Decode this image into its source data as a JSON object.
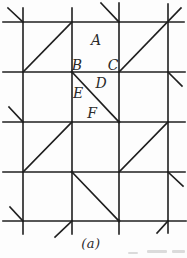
{
  "figure": {
    "type": "lattice-diagram",
    "caption": "(a)",
    "colors": {
      "background": "#fdfdfd",
      "line": "#1f1f1f",
      "label": "#2b2b2b",
      "artifact": "#8f8f8f"
    },
    "canvas": {
      "width": 187,
      "height": 258
    },
    "grid": {
      "vertical_lines": [
        {
          "x": 23,
          "y1": 8,
          "y2": 234
        },
        {
          "x": 72,
          "y1": 8,
          "y2": 234
        },
        {
          "x": 119,
          "y1": 3,
          "y2": 234
        },
        {
          "x": 168,
          "y1": 4,
          "y2": 233
        }
      ],
      "horizontal_lines": [
        {
          "y": 22,
          "x1": 3,
          "x2": 184
        },
        {
          "y": 72,
          "x1": 3,
          "x2": 185
        },
        {
          "y": 122,
          "x1": 3,
          "x2": 185
        },
        {
          "y": 172,
          "x1": 3,
          "x2": 185
        },
        {
          "y": 221,
          "x1": 3,
          "x2": 186
        }
      ],
      "diagonals": [
        {
          "x1": 23,
          "y1": 72,
          "x2": 72,
          "y2": 22
        },
        {
          "x1": 119,
          "y1": 72,
          "x2": 181,
          "y2": 8
        },
        {
          "x1": 72,
          "y1": 72,
          "x2": 119,
          "y2": 122
        },
        {
          "x1": 23,
          "y1": 172,
          "x2": 72,
          "y2": 122
        },
        {
          "x1": 119,
          "y1": 172,
          "x2": 168,
          "y2": 122
        },
        {
          "x1": 72,
          "y1": 172,
          "x2": 119,
          "y2": 221
        }
      ],
      "edge_ticks": [
        {
          "x1": 8,
          "y1": 8,
          "x2": 23,
          "y2": 22
        },
        {
          "x1": 101,
          "y1": 3,
          "x2": 119,
          "y2": 22
        },
        {
          "x1": 168,
          "y1": 72,
          "x2": 182,
          "y2": 86
        },
        {
          "x1": 9,
          "y1": 107,
          "x2": 23,
          "y2": 122
        },
        {
          "x1": 168,
          "y1": 172,
          "x2": 183,
          "y2": 186
        },
        {
          "x1": 10,
          "y1": 207,
          "x2": 23,
          "y2": 221
        },
        {
          "x1": 55,
          "y1": 237,
          "x2": 72,
          "y2": 221
        },
        {
          "x1": 157,
          "y1": 233,
          "x2": 168,
          "y2": 221
        }
      ],
      "junction_dots": [
        {
          "x": 72,
          "y": 72
        },
        {
          "x": 119,
          "y": 122
        },
        {
          "x": 72,
          "y": 172
        },
        {
          "x": 119,
          "y": 221
        }
      ]
    },
    "point_labels": [
      {
        "text": "A",
        "x": 96,
        "y": 45
      },
      {
        "text": "B",
        "x": 77,
        "y": 70
      },
      {
        "text": "C",
        "x": 113,
        "y": 70
      },
      {
        "text": "D",
        "x": 101,
        "y": 88
      },
      {
        "text": "E",
        "x": 78,
        "y": 98
      },
      {
        "text": "F",
        "x": 92,
        "y": 118
      }
    ],
    "label_font_size": 14
  }
}
